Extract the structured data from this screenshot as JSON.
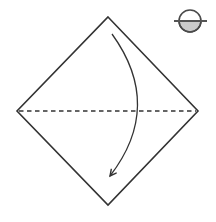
{
  "page": {
    "background": "#ffffff"
  },
  "diagram": {
    "kind": "origami-fold-step",
    "paper": {
      "shape": "diamond",
      "fill": "#ffffff",
      "stroke": "#333333"
    },
    "fold_line": {
      "style": "dashed",
      "stroke": "#333333"
    },
    "fold_arrow": {
      "style": "curved",
      "stroke": "#333333"
    },
    "corner_icon": {
      "name": "circle-fold-icon",
      "circle_stroke": "#4a4a4a",
      "line_stroke": "#555555",
      "lower_half_fill": "#cccccc"
    }
  }
}
